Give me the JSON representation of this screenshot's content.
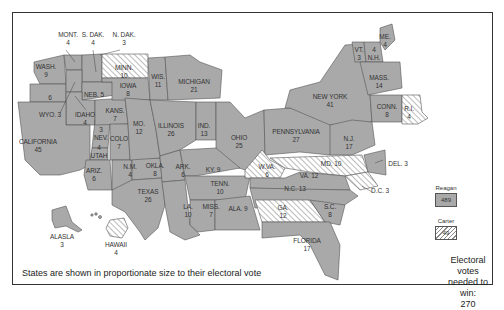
{
  "map": {
    "note": "States are shown in proportionate size to their electoral vote",
    "win_threshold": {
      "line1": "Electoral votes",
      "line2": "needed to win:",
      "value": "270"
    },
    "legend": {
      "reagan": {
        "label": "Reagan",
        "total": "489",
        "color": "#a9a9a9",
        "pattern": "solid"
      },
      "carter": {
        "label": "Carter",
        "total": "49",
        "color": "#ffffff",
        "pattern": "hatched"
      }
    },
    "states": [
      {
        "name": "MONT.",
        "votes": "4",
        "winner": "Reagan"
      },
      {
        "name": "S. DAK.",
        "votes": "4",
        "winner": "Reagan"
      },
      {
        "name": "N. DAK.",
        "votes": "3",
        "winner": "Reagan"
      },
      {
        "name": "WASH.",
        "votes": "9",
        "winner": "Reagan"
      },
      {
        "name": "OREG.",
        "votes": "6",
        "winner": "Reagan"
      },
      {
        "name": "MINN.",
        "votes": "10",
        "winner": "Carter"
      },
      {
        "name": "WIS.",
        "votes": "11",
        "winner": "Reagan"
      },
      {
        "name": "MICHIGAN",
        "votes": "21",
        "winner": "Reagan"
      },
      {
        "name": "IOWA",
        "votes": "8",
        "winner": "Reagan"
      },
      {
        "name": "NEB.",
        "votes": "5",
        "winner": "Reagan"
      },
      {
        "name": "WYO.",
        "votes": "3",
        "winner": "Reagan"
      },
      {
        "name": "IDAHO",
        "votes": "4",
        "winner": "Reagan"
      },
      {
        "name": "KANS.",
        "votes": "7",
        "winner": "Reagan"
      },
      {
        "name": "ILLINOIS",
        "votes": "26",
        "winner": "Reagan"
      },
      {
        "name": "IND.",
        "votes": "13",
        "winner": "Reagan"
      },
      {
        "name": "OHIO",
        "votes": "25",
        "winner": "Reagan"
      },
      {
        "name": "PENNSYLVANIA",
        "votes": "27",
        "winner": "Reagan"
      },
      {
        "name": "NEW YORK",
        "votes": "41",
        "winner": "Reagan"
      },
      {
        "name": "VT.",
        "votes": "3",
        "winner": "Reagan"
      },
      {
        "name": "N.H.",
        "votes": "4",
        "winner": "Reagan"
      },
      {
        "name": "ME.",
        "votes": "4",
        "winner": "Reagan"
      },
      {
        "name": "MASS.",
        "votes": "14",
        "winner": "Reagan"
      },
      {
        "name": "CONN.",
        "votes": "8",
        "winner": "Reagan"
      },
      {
        "name": "R.I.",
        "votes": "4",
        "winner": "Carter"
      },
      {
        "name": "N.J.",
        "votes": "17",
        "winner": "Reagan"
      },
      {
        "name": "CALIFORNIA",
        "votes": "45",
        "winner": "Reagan"
      },
      {
        "name": "NEV.",
        "votes": "3",
        "winner": "Reagan"
      },
      {
        "name": "UTAH",
        "votes": "4",
        "winner": "Reagan"
      },
      {
        "name": "COLO",
        "votes": "7",
        "winner": "Reagan"
      },
      {
        "name": "MO.",
        "votes": "12",
        "winner": "Reagan"
      },
      {
        "name": "ARIZ.",
        "votes": "6",
        "winner": "Reagan"
      },
      {
        "name": "N.M.",
        "votes": "4",
        "winner": "Reagan"
      },
      {
        "name": "OKLA.",
        "votes": "8",
        "winner": "Reagan"
      },
      {
        "name": "ARK.",
        "votes": "6",
        "winner": "Reagan"
      },
      {
        "name": "KY.",
        "votes": "9",
        "winner": "Reagan"
      },
      {
        "name": "TEXAS",
        "votes": "26",
        "winner": "Reagan"
      },
      {
        "name": "TENN.",
        "votes": "10",
        "winner": "Reagan"
      },
      {
        "name": "LA.",
        "votes": "10",
        "winner": "Reagan"
      },
      {
        "name": "MISS.",
        "votes": "7",
        "winner": "Reagan"
      },
      {
        "name": "ALA.",
        "votes": "9",
        "winner": "Reagan"
      },
      {
        "name": "W.VA.",
        "votes": "6",
        "winner": "Carter"
      },
      {
        "name": "MD.",
        "votes": "10",
        "winner": "Carter"
      },
      {
        "name": "VA.",
        "votes": "12",
        "winner": "Reagan"
      },
      {
        "name": "DEL.",
        "votes": "3",
        "winner": "Reagan"
      },
      {
        "name": "D.C.",
        "votes": "3",
        "winner": "Carter"
      },
      {
        "name": "N.C.",
        "votes": "13",
        "winner": "Reagan"
      },
      {
        "name": "GA.",
        "votes": "12",
        "winner": "Carter"
      },
      {
        "name": "S.C.",
        "votes": "8",
        "winner": "Reagan"
      },
      {
        "name": "FLORIDA",
        "votes": "17",
        "winner": "Reagan"
      },
      {
        "name": "ALASLA",
        "votes": "3",
        "winner": "Reagan"
      },
      {
        "name": "HAWAII",
        "votes": "4",
        "winner": "Carter"
      }
    ]
  }
}
